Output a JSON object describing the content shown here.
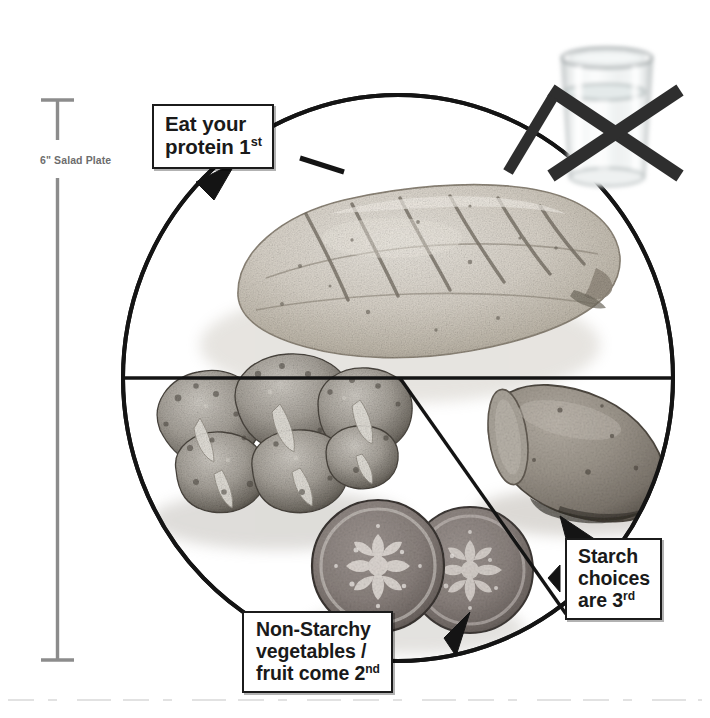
{
  "figure": {
    "background_color": "#ffffff",
    "line_color": "#1a1a1a",
    "ruler_color": "#8c8c8c"
  },
  "ruler": {
    "label": "6\" Salad Plate",
    "measure": "6 inches",
    "orientation": "vertical"
  },
  "callouts": [
    {
      "id": "protein",
      "lines": [
        "Eat your",
        "protein 1"
      ],
      "ordinal": "st",
      "line1": "Eat your",
      "line2_text": "protein 1",
      "line2_sup": "st",
      "target_section": "protein"
    },
    {
      "id": "vegetables",
      "line1": "Non-Starchy",
      "line2": "vegetables /",
      "line3_text": "fruit come 2",
      "line3_sup": "nd",
      "target_section": "vegetables"
    },
    {
      "id": "starch",
      "line1": "Starch",
      "line2": "choices",
      "line3_text": "are 3",
      "line3_sup": "rd",
      "target_section": "starch"
    }
  ],
  "plate": {
    "shape": "circle",
    "sections": [
      {
        "name": "protein",
        "fraction": "1/2",
        "food": "grilled chicken breast"
      },
      {
        "name": "vegetables",
        "fraction": "1/4",
        "food": "broccoli and tomato slices"
      },
      {
        "name": "starch",
        "fraction": "1/4",
        "food": "sweet potato"
      }
    ]
  },
  "no_drink": {
    "item": "glass of water",
    "marker": "black X",
    "meaning": "no beverage with meal"
  }
}
